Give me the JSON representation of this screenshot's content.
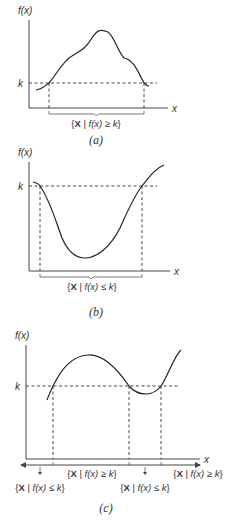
{
  "panels": [
    {
      "id": "a",
      "caption": "(a)",
      "y_label": "f(x)",
      "x_label": "x",
      "k_label": "k",
      "axis": {
        "x0": 29,
        "y_top": 20,
        "y_axis": 108,
        "x_end": 168
      },
      "k_y": 83,
      "k_line_end": 157,
      "curve": "M36,90 C42,89 45,86 49,83 C58,72 64,60 72,56 C82,50 86,48 92,38 C98,28 102,30 108,32 C114,36 118,52 124,58 C134,60 138,72 144,83 C146,85 147,86 149,86",
      "crossings": [
        49,
        144
      ],
      "brace": {
        "x1": 49,
        "x2": 144,
        "y": 111
      },
      "set_labels": [
        {
          "x": 96,
          "y": 127,
          "text_pre": "{",
          "bold": "X",
          "text_mid": " | ",
          "fx": "f(x)",
          "rel": " ≥ ",
          "k": "k",
          "text_post": "}"
        }
      ],
      "caption_pos": {
        "x": 96,
        "y": 144
      }
    },
    {
      "id": "b",
      "caption": "(b)",
      "y_label": "f(x)",
      "x_label": "x",
      "k_label": "k",
      "axis": {
        "x0": 29,
        "y_top": 162,
        "y_axis": 271,
        "x_end": 170
      },
      "k_y": 186,
      "k_line_end": 157,
      "curve": "M33,182 C37,183 39,184 40,186 C50,200 56,222 62,238 C68,252 76,258 85,258 C96,258 110,248 120,228 C128,210 134,196 142,186 C150,176 156,168 164,165",
      "crossings": [
        40,
        142
      ],
      "brace": {
        "x1": 40,
        "x2": 142,
        "y": 274
      },
      "set_labels": [
        {
          "x": 92,
          "y": 290,
          "text_pre": "{",
          "bold": "X",
          "text_mid": " | ",
          "fx": "f(x)",
          "rel": " ≤ ",
          "k": "k",
          "text_post": "}"
        }
      ],
      "caption_pos": {
        "x": 96,
        "y": 316
      }
    },
    {
      "id": "c",
      "caption": "(c)",
      "y_label": "f(x)",
      "x_label": "x",
      "k_label": "k",
      "axis": {
        "x0": 26,
        "y_top": 345,
        "y_axis": 459,
        "x_end": 200
      },
      "k_y": 386,
      "k_line_end": 179,
      "curve": "M47,400 C49,395 51,390 53,386 C62,368 72,356 88,355 C104,354 118,370 129,386 C134,392 140,394 146,394 C152,394 157,391 161,386 C168,376 174,356 181,350",
      "crossings": [
        53,
        129,
        161
      ],
      "bracket_line": {
        "x1": 21,
        "x2": 200,
        "y": 465
      },
      "ticks": [
        53,
        129,
        161
      ],
      "down_arrows": [
        40,
        145
      ],
      "set_labels": [
        {
          "x": 92,
          "y": 477,
          "text_pre": "{",
          "bold": "X",
          "text_mid": " | ",
          "fx": "f(x)",
          "rel": " ≥ ",
          "k": "k",
          "text_post": "}"
        },
        {
          "x": 198,
          "y": 477,
          "text_pre": "{",
          "bold": "X",
          "text_mid": " | ",
          "fx": "f(x)",
          "rel": " ≥ ",
          "k": "k",
          "text_post": "}"
        },
        {
          "x": 40,
          "y": 491,
          "text_pre": "{",
          "bold": "X",
          "text_mid": " | ",
          "fx": "f(x)",
          "rel": " ≤ ",
          "k": "k",
          "text_post": "}"
        },
        {
          "x": 145,
          "y": 491,
          "text_pre": "{",
          "bold": "X",
          "text_mid": " | ",
          "fx": "f(x)",
          "rel": " ≤ ",
          "k": "k",
          "text_post": "}"
        }
      ],
      "caption_pos": {
        "x": 106,
        "y": 512
      }
    }
  ]
}
